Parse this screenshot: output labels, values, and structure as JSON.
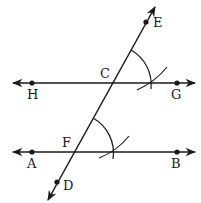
{
  "figure": {
    "colors": {
      "stroke": "#1a1a1a",
      "background": "#ffffff"
    },
    "points": {
      "E": {
        "label": "E",
        "x": 146,
        "y": 21
      },
      "C": {
        "label": "C",
        "x": 111,
        "y": 83
      },
      "H": {
        "label": "H",
        "x": 32,
        "y": 83
      },
      "G": {
        "label": "G",
        "x": 177,
        "y": 83
      },
      "F": {
        "label": "F",
        "x": 73,
        "y": 152
      },
      "A": {
        "label": "A",
        "x": 32,
        "y": 152
      },
      "B": {
        "label": "B",
        "x": 177,
        "y": 152
      },
      "D": {
        "label": "D",
        "x": 57,
        "y": 181
      }
    },
    "lines": [
      {
        "name": "line-HG",
        "from": "H",
        "to": "G",
        "type": "line"
      },
      {
        "name": "line-AB",
        "from": "A",
        "to": "B",
        "type": "line"
      },
      {
        "name": "transversal-DE",
        "from": "D",
        "to": "E",
        "type": "line"
      }
    ],
    "arcs": [
      {
        "name": "angle-arc-at-C",
        "center": "C"
      },
      {
        "name": "intersect-arc-at-C",
        "center": "C"
      },
      {
        "name": "angle-arc-at-F",
        "center": "F"
      },
      {
        "name": "intersect-arc-at-F",
        "center": "F"
      }
    ]
  }
}
